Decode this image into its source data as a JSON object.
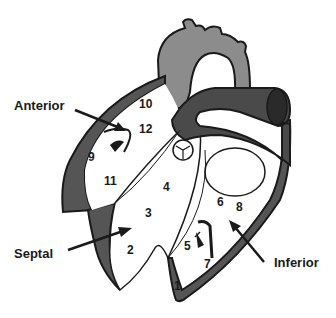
{
  "diagram": {
    "views": [
      {
        "label": "Anterior"
      },
      {
        "label": "Septal"
      },
      {
        "label": "Inferior"
      }
    ],
    "segments": [
      "1",
      "2",
      "3",
      "4",
      "5",
      "6",
      "7",
      "8",
      "9",
      "10",
      "11",
      "12"
    ],
    "colors": {
      "aorta": "#8c8c8c",
      "pulmonary": "#4a4a4a",
      "wall": "#555555",
      "outline": "#1a1a1a",
      "background": "#ffffff"
    }
  }
}
